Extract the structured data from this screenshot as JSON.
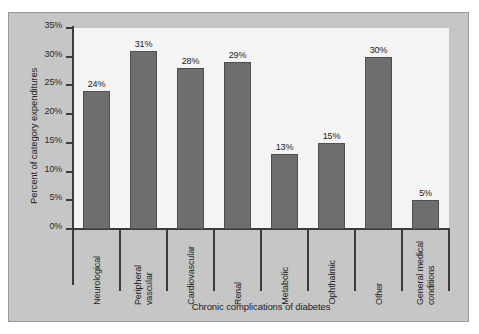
{
  "chart_data": {
    "type": "bar",
    "title": "",
    "xlabel": "Chronic complications of diabetes",
    "ylabel": "Percent of category expenditures",
    "categories": [
      "Neurological",
      "Peripheral\nvascular",
      "Cardiovascular",
      "Renal",
      "Metabolic",
      "Ophthalmic",
      "Other",
      "General medical\nconditions"
    ],
    "values": [
      24,
      31,
      28,
      29,
      13,
      15,
      30,
      5
    ],
    "value_labels": [
      "24%",
      "31%",
      "28%",
      "29%",
      "13%",
      "15%",
      "30%",
      "5%"
    ],
    "ylim": [
      0,
      35
    ],
    "ytick_labels": [
      "0%",
      "5%",
      "10%",
      "15%",
      "20%",
      "25%",
      "30%",
      "35%"
    ],
    "ytick_values": [
      0,
      5,
      10,
      15,
      20,
      25,
      30,
      35
    ],
    "grid": false,
    "legend": "none",
    "colors": {
      "bar_fill": "#6e6e6e",
      "bar_edge": "#4f4f4f",
      "panel_background": "#c6c6c6",
      "plot_background": "#f4f4f4",
      "axis": "#3b3b3b",
      "text": "#232323"
    }
  }
}
